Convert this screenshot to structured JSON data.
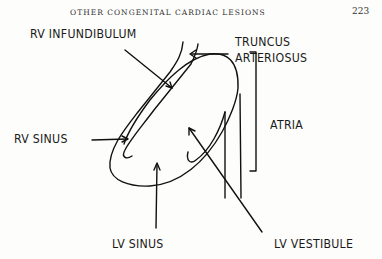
{
  "header": {
    "running_head": "OTHER CONGENITAL CARDIAC LESIONS",
    "page_number": "223"
  },
  "diagram": {
    "labels": {
      "rv_infundibulum": "RV INFUNDIBULUM",
      "truncus_line1": "TRUNCUS",
      "truncus_line2": "ARTERIOSUS",
      "atria": "ATRIA",
      "rv_sinus": "RV SINUS",
      "lv_sinus": "LV SINUS",
      "lv_vestibule": "LV VESTIBULE"
    },
    "stroke_color": "#111111"
  }
}
